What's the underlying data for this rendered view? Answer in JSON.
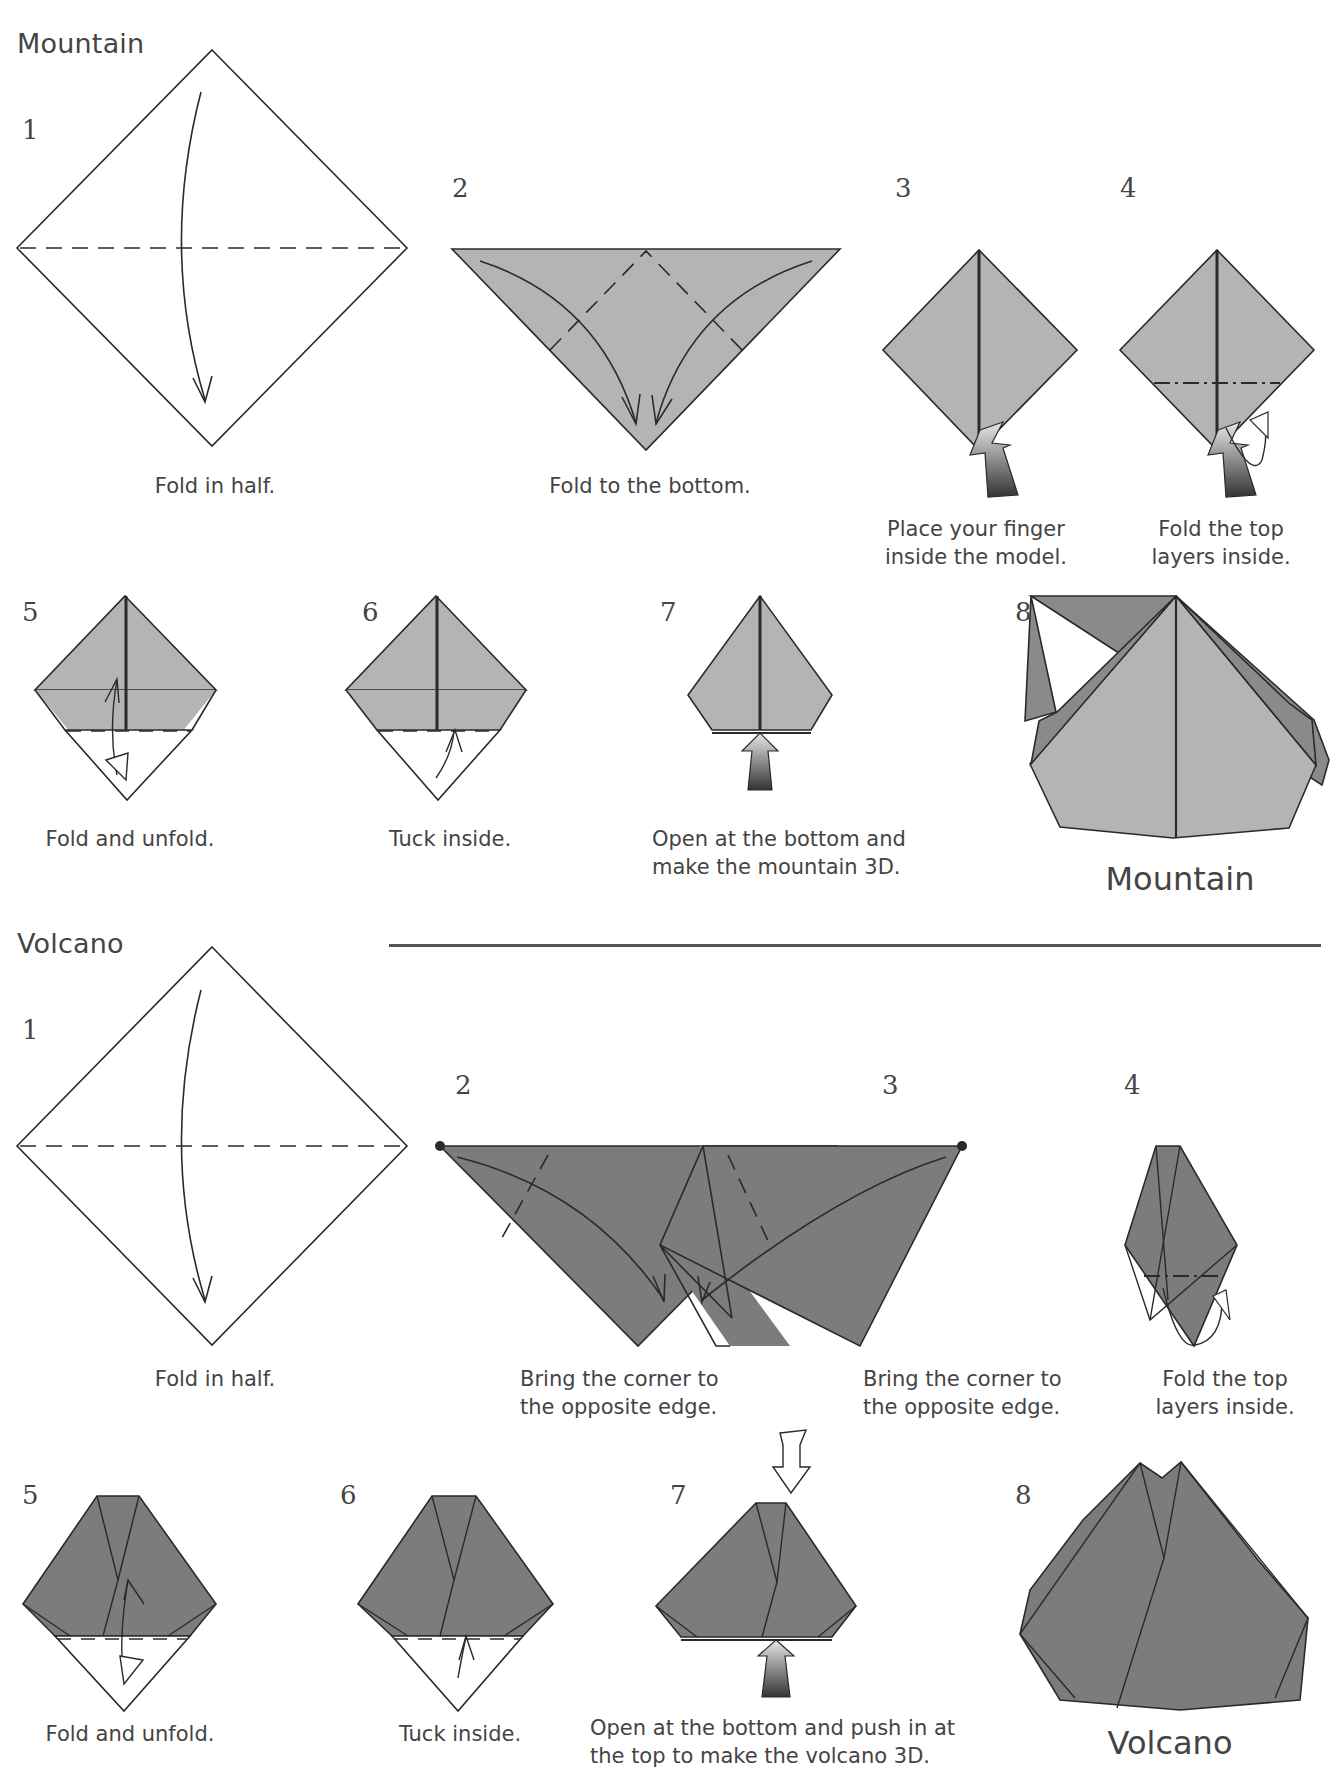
{
  "sections": [
    {
      "title": "Mountain",
      "final_name": "Mountain",
      "steps": [
        {
          "num": "1",
          "caption": "Fold in half."
        },
        {
          "num": "2",
          "caption": "Fold to the bottom."
        },
        {
          "num": "3",
          "caption_lines": [
            "Place your finger",
            "inside the model."
          ]
        },
        {
          "num": "4",
          "caption_lines": [
            "Fold the top",
            "layers inside."
          ]
        },
        {
          "num": "5",
          "caption": "Fold and unfold."
        },
        {
          "num": "6",
          "caption": "Tuck inside."
        },
        {
          "num": "7",
          "caption_lines": [
            "Open at the bottom and",
            "make the mountain 3D."
          ]
        },
        {
          "num": "8",
          "caption": ""
        }
      ]
    },
    {
      "title": "Volcano",
      "final_name": "Volcano",
      "steps": [
        {
          "num": "1",
          "caption": "Fold in half."
        },
        {
          "num": "2",
          "caption_lines": [
            "Bring the corner to",
            "the opposite edge."
          ]
        },
        {
          "num": "3",
          "caption_lines": [
            "Bring the corner to",
            "the opposite edge."
          ]
        },
        {
          "num": "4",
          "caption_lines": [
            "Fold the top",
            "layers inside."
          ]
        },
        {
          "num": "5",
          "caption": "Fold and unfold."
        },
        {
          "num": "6",
          "caption": "Tuck inside."
        },
        {
          "num": "7",
          "caption_lines": [
            "Open at the bottom and push in at",
            "the top to make the volcano 3D."
          ]
        },
        {
          "num": "8",
          "caption": ""
        }
      ]
    }
  ],
  "colors": {
    "mountain_paper": "#b4b4b4",
    "mountain_dark": "#8a8a8a",
    "volcano_paper": "#7c7c7c",
    "line": "#2a2a2a",
    "text": "#444444"
  }
}
